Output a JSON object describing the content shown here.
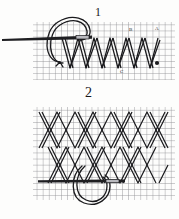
{
  "page": {
    "background_color": "#fdfdfc",
    "ink_color": "#1a1a1d",
    "grid_color": "#8d8d92"
  },
  "figures": [
    {
      "id": "figure-1",
      "number": "1",
      "caption": "1",
      "description": "Single row of zigzag stitch worked on canvas grid with needle entering the fabric and working thread looped to the left",
      "grid": {
        "x": 33,
        "y": 22,
        "width": 142,
        "height": 58,
        "cell_size": 6.1,
        "color": "#8d8d92"
      },
      "needle": {
        "name": "needle",
        "x1": 2,
        "y1": 39,
        "x2": 92,
        "y2": 37,
        "eye_x": 78,
        "eye_y": 37
      },
      "thread_loop": {
        "name": "thread-loop",
        "center_x": 62,
        "center_y": 40,
        "radius_x": 18,
        "radius_y": 22
      },
      "zigzag": {
        "top_y": 38,
        "bottom_y": 68,
        "points": [
          [
            62,
            38
          ],
          [
            70,
            68
          ],
          [
            78,
            38
          ],
          [
            86,
            68
          ],
          [
            94,
            38
          ],
          [
            102,
            68
          ],
          [
            110,
            38
          ],
          [
            118,
            68
          ],
          [
            126,
            38
          ],
          [
            134,
            68
          ],
          [
            142,
            38
          ],
          [
            150,
            68
          ],
          [
            158,
            38
          ]
        ]
      },
      "markers": [
        {
          "label": "B",
          "x": 129,
          "y": 29
        },
        {
          "label": "A",
          "x": 155,
          "y": 28
        },
        {
          "label": "C",
          "x": 120,
          "y": 70
        }
      ]
    },
    {
      "id": "figure-2",
      "number": "2",
      "caption": "2",
      "description": "Two interlocking rows of crossed zigzag (herringbone) stitching with needle and looped working thread at lower centre",
      "grid": {
        "x": 33,
        "y": 107,
        "width": 142,
        "height": 93,
        "cell_size": 6.1,
        "color": "#8d8d92"
      },
      "needle": {
        "name": "needle",
        "x1": 38,
        "y1": 181,
        "x2": 125,
        "y2": 181,
        "eye_x": 112,
        "eye_y": 181
      },
      "thread_loop": {
        "name": "thread-loop",
        "center_x": 94,
        "center_y": 183,
        "radius_x": 17,
        "radius_y": 22
      },
      "rows": [
        {
          "name": "upper-row",
          "top_y": 112,
          "bottom_y": 148
        },
        {
          "name": "lower-row",
          "top_y": 148,
          "bottom_y": 183
        }
      ]
    }
  ]
}
